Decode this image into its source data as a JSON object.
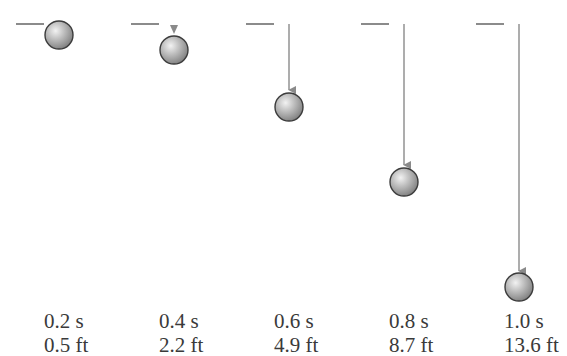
{
  "diagram": {
    "type": "falling-ball-time-sequence",
    "colors": {
      "reference_line": "#6e6e6e",
      "arrow": "#8a8a8a",
      "ball_highlight": "#f2f2f2",
      "ball_mid": "#b9b9b9",
      "ball_shadow": "#7d7d7d",
      "ball_outline": "#3c3c3c",
      "text": "#3a3a3a"
    },
    "frames": [
      {
        "time_label": "0.2 s",
        "distance_label": "0.5 ft",
        "time_s": 0.2,
        "distance_ft": 0.5
      },
      {
        "time_label": "0.4 s",
        "distance_label": "2.2 ft",
        "time_s": 0.4,
        "distance_ft": 2.2
      },
      {
        "time_label": "0.6 s",
        "distance_label": "4.9 ft",
        "time_s": 0.6,
        "distance_ft": 4.9
      },
      {
        "time_label": "0.8 s",
        "distance_label": "8.7 ft",
        "time_s": 0.8,
        "distance_ft": 8.7
      },
      {
        "time_label": "1.0 s",
        "distance_label": "13.6 ft",
        "time_s": 1.0,
        "distance_ft": 13.6
      }
    ]
  }
}
